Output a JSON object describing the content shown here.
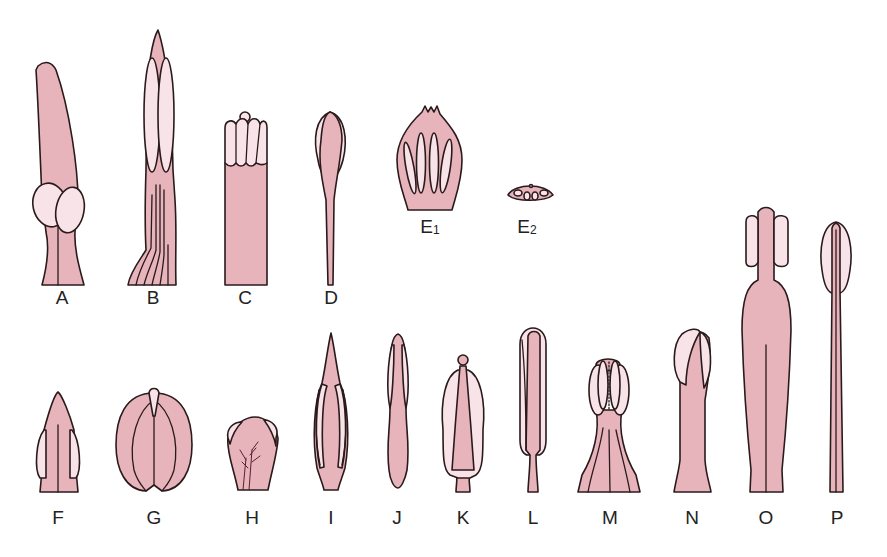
{
  "figure": {
    "colors": {
      "filament": "#e7b4bb",
      "anther": "#f8e4e8",
      "outline": "#2a1a1c",
      "background": "#ffffff"
    },
    "panels": [
      {
        "id": "A",
        "label": "A",
        "x": 62,
        "y": 296
      },
      {
        "id": "B",
        "label": "B",
        "x": 153,
        "y": 296
      },
      {
        "id": "C",
        "label": "C",
        "x": 245,
        "y": 296
      },
      {
        "id": "D",
        "label": "D",
        "x": 331,
        "y": 296
      },
      {
        "id": "E1",
        "label": "E",
        "sub": "1",
        "x": 430,
        "y": 236
      },
      {
        "id": "E2",
        "label": "E",
        "sub": "2",
        "x": 527,
        "y": 236
      },
      {
        "id": "F",
        "label": "F",
        "x": 58,
        "y": 506
      },
      {
        "id": "G",
        "label": "G",
        "x": 154,
        "y": 506
      },
      {
        "id": "H",
        "label": "H",
        "x": 252,
        "y": 506
      },
      {
        "id": "I",
        "label": "I",
        "x": 331,
        "y": 506
      },
      {
        "id": "J",
        "label": "J",
        "x": 397,
        "y": 506
      },
      {
        "id": "K",
        "label": "K",
        "x": 463,
        "y": 518
      },
      {
        "id": "L",
        "label": "L",
        "x": 533,
        "y": 518
      },
      {
        "id": "M",
        "label": "M",
        "x": 610,
        "y": 518
      },
      {
        "id": "N",
        "label": "N",
        "x": 692,
        "y": 518
      },
      {
        "id": "O",
        "label": "O",
        "x": 766,
        "y": 518
      },
      {
        "id": "P",
        "label": "P",
        "x": 837,
        "y": 518
      }
    ]
  }
}
